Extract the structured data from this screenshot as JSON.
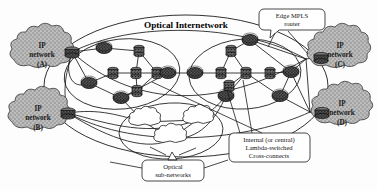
{
  "figure": {
    "title": "Optical Internetwork",
    "background_color": "#fdfdfd",
    "line_color": "#1a1a1a"
  },
  "labels": {
    "optical_internetwork": "Optical Internetwork",
    "edge_mpls_router_line1": "Edge MPLS",
    "edge_mpls_router_line2": "router",
    "optical_subnetworks_line1": "Optical",
    "optical_subnetworks_line2": "sub-networks",
    "crossconnects_line1": "Internal (or central)",
    "crossconnects_line2": "Lambda-switched",
    "crossconnects_line3": "Cross-connects"
  },
  "ip_networks": [
    {
      "id": "A",
      "line1": "IP",
      "line2": "network",
      "line3": "(A)",
      "cx": 42,
      "cy": 57,
      "rx": 34,
      "ry": 24
    },
    {
      "id": "B",
      "line1": "IP",
      "line2": "network",
      "line3": "(B)",
      "cx": 38,
      "cy": 119,
      "rx": 32,
      "ry": 23
    },
    {
      "id": "C",
      "line1": "IP",
      "line2": "network",
      "line3": "(C)",
      "cx": 338,
      "cy": 57,
      "rx": 33,
      "ry": 24
    },
    {
      "id": "D",
      "line1": "IP",
      "line2": "network",
      "line3": "(D)",
      "cx": 341,
      "cy": 114,
      "rx": 31,
      "ry": 23
    }
  ],
  "subnetwork_ellipses": [
    {
      "name": "left-optical-subnetwork",
      "cx": 122,
      "cy": 74,
      "rx": 58,
      "ry": 35,
      "rot": -6
    },
    {
      "name": "right-optical-subnetwork",
      "cx": 245,
      "cy": 74,
      "rx": 56,
      "ry": 35,
      "rot": -4
    },
    {
      "name": "bottom-optical-subnetwork",
      "cx": 171,
      "cy": 131,
      "rx": 52,
      "ry": 28,
      "rot": -2
    }
  ],
  "outer_ellipse": {
    "name": "optical-internetwork-boundary",
    "cx": 186,
    "cy": 86,
    "rx": 142,
    "ry": 71
  },
  "edge_routers": [
    {
      "name": "edge-router-a",
      "cx": 72,
      "cy": 52
    },
    {
      "name": "edge-router-b",
      "cx": 68,
      "cy": 113
    },
    {
      "name": "edge-router-c",
      "cx": 306,
      "cy": 59
    },
    {
      "name": "edge-router-d",
      "cx": 310,
      "cy": 112
    }
  ],
  "routers": [
    {
      "name": "router-l1",
      "cx": 104,
      "cy": 48
    },
    {
      "name": "router-l2",
      "cx": 89,
      "cy": 83
    },
    {
      "name": "router-l3",
      "cx": 121,
      "cy": 98
    },
    {
      "name": "router-l4",
      "cx": 168,
      "cy": 73
    },
    {
      "name": "router-r1",
      "cx": 195,
      "cy": 73
    },
    {
      "name": "router-r2",
      "cx": 250,
      "cy": 40
    },
    {
      "name": "router-r3",
      "cx": 226,
      "cy": 96
    },
    {
      "name": "router-r4",
      "cx": 280,
      "cy": 96
    },
    {
      "name": "router-r5",
      "cx": 291,
      "cy": 72
    }
  ],
  "crossconnects": [
    {
      "name": "xc-l1",
      "cx": 139,
      "cy": 51
    },
    {
      "name": "xc-l2",
      "cx": 113,
      "cy": 73
    },
    {
      "name": "xc-l3",
      "cx": 136,
      "cy": 73
    },
    {
      "name": "xc-l4",
      "cx": 157,
      "cy": 73
    },
    {
      "name": "xc-l5",
      "cx": 137,
      "cy": 91
    },
    {
      "name": "xc-r1",
      "cx": 231,
      "cy": 51
    },
    {
      "name": "xc-r2",
      "cx": 221,
      "cy": 73
    },
    {
      "name": "xc-r3",
      "cx": 246,
      "cy": 73
    },
    {
      "name": "xc-r4",
      "cx": 270,
      "cy": 73
    },
    {
      "name": "xc-r5",
      "cx": 229,
      "cy": 86
    }
  ],
  "optical_clouds": [
    {
      "name": "optical-cloud-1",
      "cx": 144,
      "cy": 122,
      "rx": 18,
      "ry": 10
    },
    {
      "name": "optical-cloud-2",
      "cx": 197,
      "cy": 120,
      "rx": 17,
      "ry": 10
    },
    {
      "name": "optical-cloud-3",
      "cx": 171,
      "cy": 139,
      "rx": 19,
      "ry": 10
    }
  ],
  "callouts": [
    {
      "name": "edge-mpls-router-callout",
      "x": 261,
      "y": 9,
      "w": 62,
      "h": 21
    },
    {
      "name": "optical-subnetworks-callout",
      "x": 142,
      "y": 160,
      "w": 61,
      "h": 21
    },
    {
      "name": "crossconnects-callout",
      "x": 229,
      "y": 133,
      "w": 81,
      "h": 29
    }
  ]
}
